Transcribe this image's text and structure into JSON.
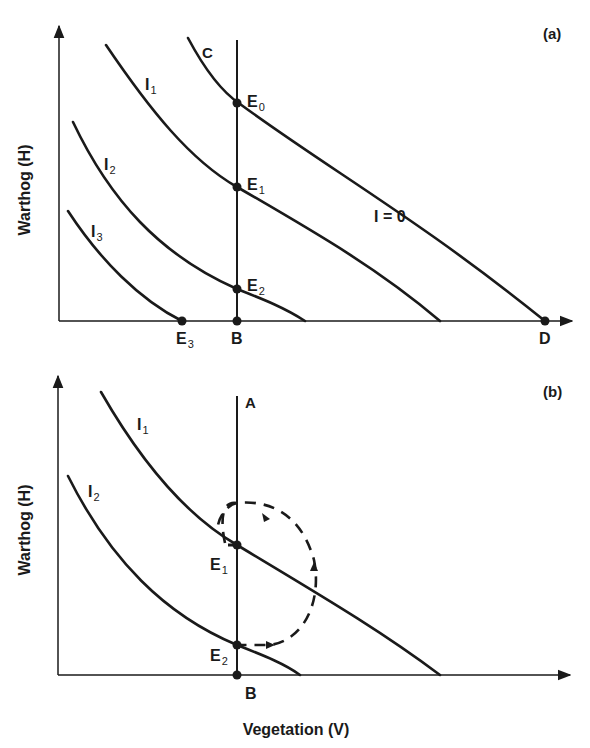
{
  "panel_a": {
    "tag": "(a)",
    "y_axis_label": "Warthog (H)",
    "curves": {
      "C": "C",
      "I1": {
        "base": "I",
        "sub": "1"
      },
      "I2": {
        "base": "I",
        "sub": "2"
      },
      "I3": {
        "base": "I",
        "sub": "3"
      },
      "zero": "I = 0"
    },
    "points": {
      "E0": {
        "base": "E",
        "sub": "0"
      },
      "E1": {
        "base": "E",
        "sub": "1"
      },
      "E2": {
        "base": "E",
        "sub": "2"
      },
      "E3": {
        "base": "E",
        "sub": "3"
      },
      "B": "B",
      "D": "D"
    }
  },
  "panel_b": {
    "tag": "(b)",
    "y_axis_label": "Warthog (H)",
    "x_axis_label": "Vegetation (V)",
    "vertical_line_label": "A",
    "curves": {
      "I1": {
        "base": "I",
        "sub": "1"
      },
      "I2": {
        "base": "I",
        "sub": "2"
      }
    },
    "points": {
      "E1": {
        "base": "E",
        "sub": "1"
      },
      "E2": {
        "base": "E",
        "sub": "2"
      },
      "B": "B"
    },
    "cycle": "dashed clockwise orbit around E1 between E1 and E2"
  },
  "colors": {
    "ink": "#1a1a1a",
    "background": "#ffffff"
  }
}
